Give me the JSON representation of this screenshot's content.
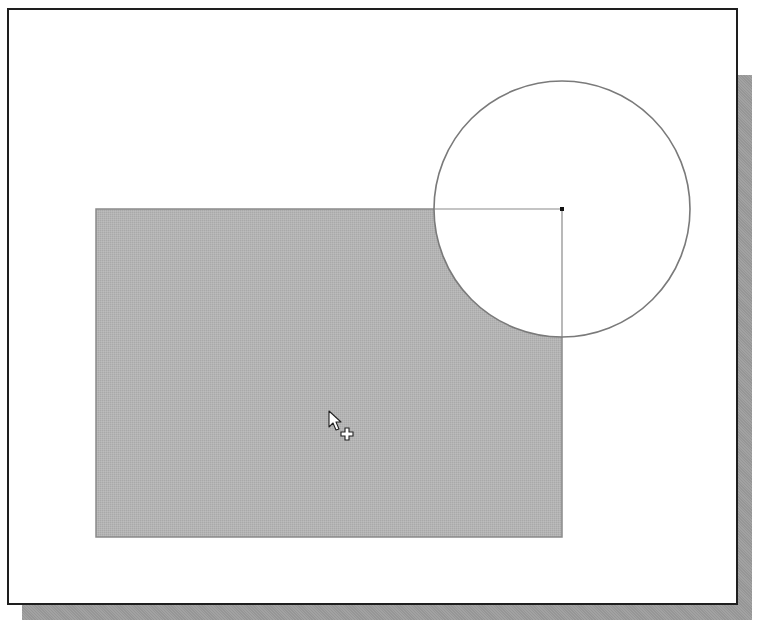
{
  "scene": {
    "description": "Sketch viewport showing a filled rectangle region with a circular cutout at its top-right corner, and a selection cursor with plus sign",
    "colors": {
      "background": "#ffffff",
      "frame_border": "#1e1e1e",
      "shadow": "#9c9c9c",
      "region_fill": "#b4b4b4",
      "region_edge": "#8a8a8a",
      "circle_stroke": "#7a7a7a",
      "center_marker": "#111111"
    },
    "rectangle": {
      "x": 96,
      "y": 209,
      "width": 466,
      "height": 328
    },
    "circle": {
      "cx": 562,
      "cy": 209,
      "r": 128
    },
    "center_marker": {
      "x": 562,
      "y": 209,
      "size": 4
    },
    "cursor": {
      "type": "arrow-with-plus",
      "x": 329,
      "y": 411
    }
  }
}
